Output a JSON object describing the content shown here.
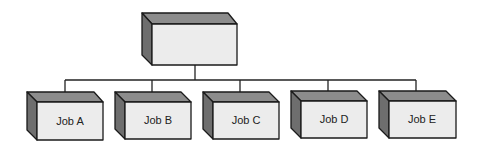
{
  "diagram": {
    "type": "org-chart",
    "root": {
      "label": ""
    },
    "children": [
      {
        "label": "Job A"
      },
      {
        "label": "Job B"
      },
      {
        "label": "Job C"
      },
      {
        "label": "Job D"
      },
      {
        "label": "Job E"
      }
    ],
    "colors": {
      "front": "#ececec",
      "top": "#8c8c8c",
      "side": "#6e6e6e",
      "stroke": "#1a1a1a"
    }
  }
}
